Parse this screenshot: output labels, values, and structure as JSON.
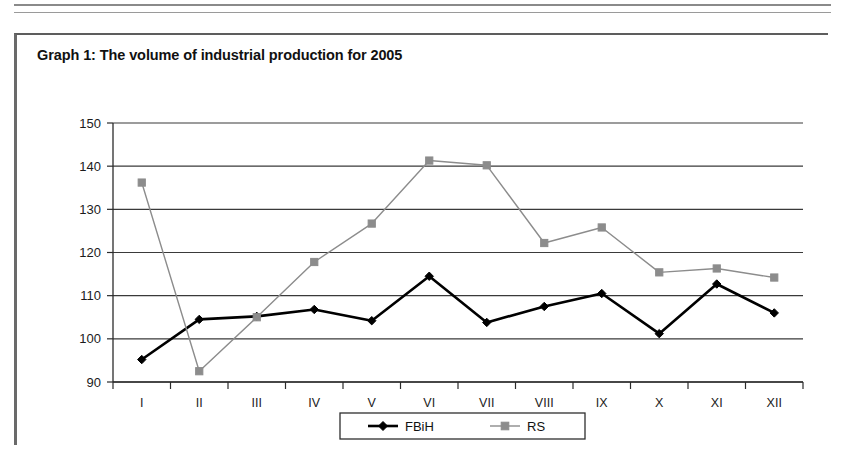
{
  "figure": {
    "title": "Graph 1: The volume of industrial production for 2005"
  },
  "colors": {
    "series_fbih": "#000000",
    "series_rs": "#8c8c8c",
    "gridline": "#3a3a3a",
    "axis": "#2b2b2b",
    "text": "#111111",
    "background": "#ffffff"
  },
  "chart_data": {
    "type": "line",
    "title": "Graph 1: The volume of industrial production for 2005",
    "xlabel": "",
    "ylabel": "",
    "categories": [
      "I",
      "II",
      "III",
      "IV",
      "V",
      "VI",
      "VII",
      "VIII",
      "IX",
      "X",
      "XI",
      "XII"
    ],
    "ylim": [
      90,
      150
    ],
    "yticks": [
      90,
      100,
      110,
      120,
      130,
      140,
      150
    ],
    "grid": true,
    "legend_position": "bottom",
    "series": [
      {
        "name": "FBiH",
        "marker": "diamond",
        "color": "#000000",
        "values": [
          95.2,
          104.5,
          105.2,
          106.8,
          104.2,
          114.5,
          103.8,
          107.5,
          110.5,
          101.2,
          112.7,
          106.0
        ]
      },
      {
        "name": "RS",
        "marker": "square",
        "color": "#8c8c8c",
        "values": [
          136.2,
          92.5,
          105.0,
          117.8,
          126.7,
          141.3,
          140.2,
          122.2,
          125.8,
          115.4,
          116.3,
          114.2
        ]
      }
    ]
  }
}
